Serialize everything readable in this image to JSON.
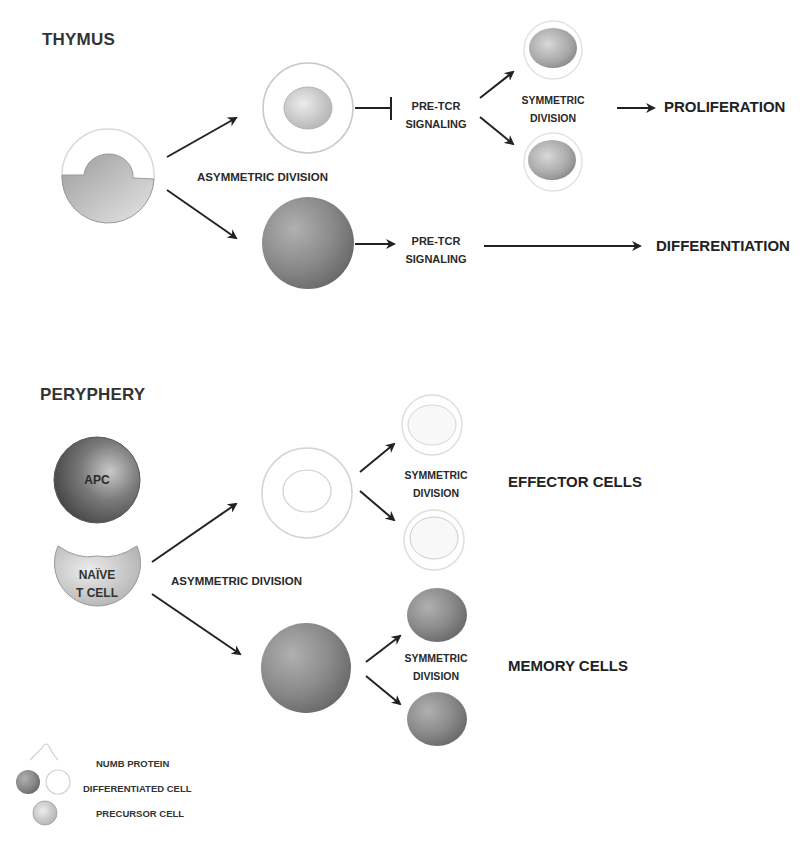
{
  "thymus": {
    "title": "THYMUS",
    "asymmetric_label": "ASYMMETRIC DIVISION",
    "upper_branch": {
      "signal_label_line1": "PRE-TCR",
      "signal_label_line2": "SIGNALING",
      "signal_effect": "inhibited",
      "division_line1": "SYMMETRIC",
      "division_line2": "DIVISION",
      "outcome": "PROLIFERATION"
    },
    "lower_branch": {
      "signal_label_line1": "PRE-TCR",
      "signal_label_line2": "SIGNALING",
      "signal_effect": "activated",
      "outcome": "DIFFERENTIATION"
    }
  },
  "periphery": {
    "title": "PERYPHERY",
    "apc_label": "APC",
    "naive_line1": "NAÏVE",
    "naive_line2": "T CELL",
    "asymmetric_label": "ASYMMETRIC DIVISION",
    "upper_branch": {
      "division_line1": "SYMMETRIC",
      "division_line2": "DIVISION",
      "outcome": "EFFECTOR CELLS"
    },
    "lower_branch": {
      "division_line1": "SYMMETRIC",
      "division_line2": "DIVISION",
      "outcome": "MEMORY CELLS"
    }
  },
  "legend": {
    "items": [
      {
        "label": "NUMB PROTEIN",
        "icon": "numb-protein-arc"
      },
      {
        "label": "DIFFERENTIATED CELL",
        "icon": "dark-sphere-and-ring"
      },
      {
        "label": "PRECURSOR CELL",
        "icon": "light-sphere"
      }
    ]
  },
  "colors": {
    "background": "#ffffff",
    "text": "#222222",
    "arrow": "#222222",
    "differentiated_dark": "#7a7a7a",
    "precursor_light": "#c8c8c8",
    "apc_dark": "#4a4a4a",
    "numb_ring": "#dcdcdc"
  }
}
